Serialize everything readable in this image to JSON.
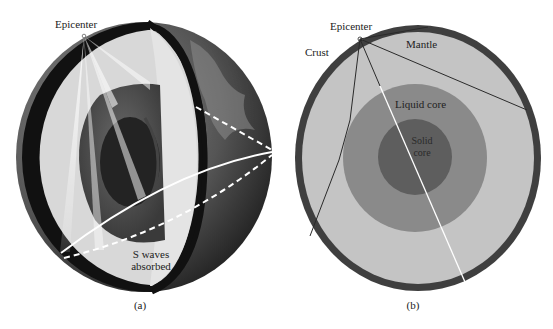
{
  "figure_a": {
    "caption": "(a)",
    "labels": {
      "epicenter": "Epicenter",
      "s_waves_line1": "S waves",
      "s_waves_line2": "absorbed"
    },
    "colors": {
      "crust": "#111111",
      "mantle": "#d6d6d6",
      "liquid_core": "#555555",
      "solid_core": "#2a2a2a",
      "surface": "#5a5a5a",
      "rays": "#ffffff"
    }
  },
  "figure_b": {
    "caption": "(b)",
    "labels": {
      "epicenter": "Epicenter",
      "crust": "Crust",
      "mantle": "Mantle",
      "liquid_core": "Liquid core",
      "solid_core_line1": "Solid",
      "solid_core_line2": "core"
    },
    "colors": {
      "crust": "#3f3f3f",
      "mantle": "#c4c4c4",
      "liquid_core": "#8a8a8a",
      "solid_core": "#5e5e5e",
      "ray_dark": "#2a2a2a",
      "ray_light": "#ffffff"
    }
  }
}
